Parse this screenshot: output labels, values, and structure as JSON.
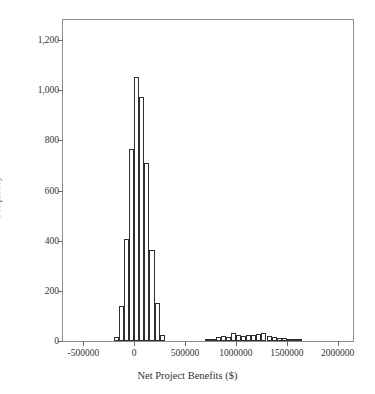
{
  "chart_data": {
    "type": "bar",
    "subtype": "histogram",
    "title": "",
    "xlabel": "Net Project Benefits ($)",
    "ylabel": "Frequency",
    "xlim": [
      -700000,
      2150000
    ],
    "ylim": [
      0,
      1280
    ],
    "grid": false,
    "legend": null,
    "xticks": [
      -500000,
      0,
      500000,
      1000000,
      1500000,
      2000000
    ],
    "xticklabels": [
      "-500000",
      "0",
      "500000",
      "1000000",
      "1500000",
      "2000000"
    ],
    "yticks": [
      0,
      200,
      400,
      600,
      800,
      1000,
      1200
    ],
    "yticklabels": [
      "0",
      "200",
      "400",
      "600",
      "800",
      "1,000",
      "1,200"
    ],
    "bin_width": 50000,
    "bar_fill": "#ffffff",
    "bar_edge": "#2e2e2e",
    "frame_color": "#8d8d8d",
    "bins": [
      {
        "x": -175000,
        "value": 18
      },
      {
        "x": -125000,
        "value": 140
      },
      {
        "x": -75000,
        "value": 405
      },
      {
        "x": -25000,
        "value": 765
      },
      {
        "x": 25000,
        "value": 1052
      },
      {
        "x": 75000,
        "value": 975
      },
      {
        "x": 125000,
        "value": 708
      },
      {
        "x": 175000,
        "value": 362
      },
      {
        "x": 225000,
        "value": 150
      },
      {
        "x": 275000,
        "value": 22
      },
      {
        "x": 725000,
        "value": 4
      },
      {
        "x": 775000,
        "value": 9
      },
      {
        "x": 825000,
        "value": 16
      },
      {
        "x": 875000,
        "value": 20
      },
      {
        "x": 925000,
        "value": 18
      },
      {
        "x": 975000,
        "value": 30
      },
      {
        "x": 1025000,
        "value": 24
      },
      {
        "x": 1075000,
        "value": 19
      },
      {
        "x": 1125000,
        "value": 25
      },
      {
        "x": 1175000,
        "value": 22
      },
      {
        "x": 1225000,
        "value": 28
      },
      {
        "x": 1275000,
        "value": 31
      },
      {
        "x": 1325000,
        "value": 21
      },
      {
        "x": 1375000,
        "value": 16
      },
      {
        "x": 1425000,
        "value": 12
      },
      {
        "x": 1475000,
        "value": 11
      },
      {
        "x": 1525000,
        "value": 6
      },
      {
        "x": 1575000,
        "value": 4
      },
      {
        "x": 1625000,
        "value": 2
      }
    ]
  }
}
